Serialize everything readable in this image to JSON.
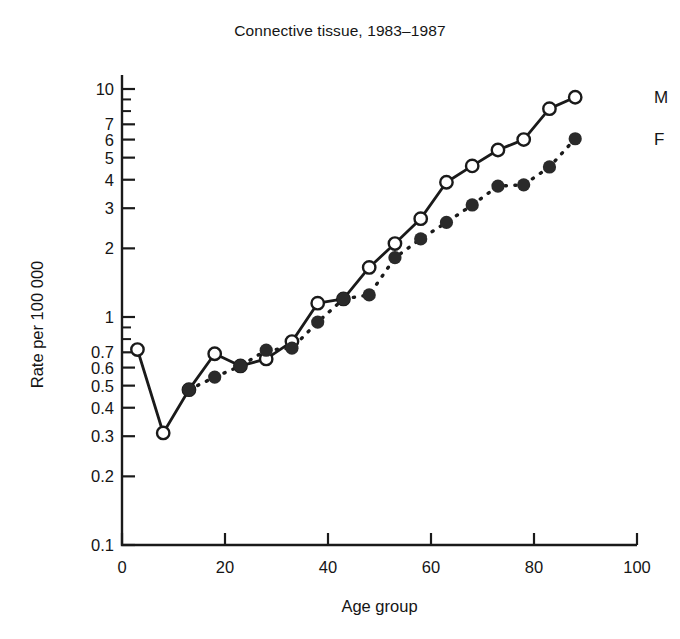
{
  "chart_data": {
    "type": "line",
    "title": "Connective tissue, 1983–1987",
    "xlabel": "Age group",
    "ylabel": "Rate per 100 000",
    "yscale": "log",
    "ylim": [
      0.1,
      11
    ],
    "xlim": [
      0,
      100
    ],
    "grid": false,
    "legend_position": "right",
    "ytick_labels": [
      "0.1",
      "0.2",
      "0.3",
      "0.4",
      "0.5",
      "0.6",
      "0.7",
      "1",
      "2",
      "3",
      "4",
      "5",
      "6",
      "7",
      "10"
    ],
    "ytick_values": [
      0.1,
      0.2,
      0.3,
      0.4,
      0.5,
      0.6,
      0.7,
      1,
      2,
      3,
      4,
      5,
      6,
      7,
      10
    ],
    "xtick_labels": [
      "0",
      "20",
      "40",
      "60",
      "80",
      "100"
    ],
    "xtick_values": [
      0,
      20,
      40,
      60,
      80,
      100
    ],
    "x": [
      3,
      8,
      13,
      18,
      23,
      28,
      33,
      38,
      43,
      48,
      53,
      58,
      63,
      68,
      73,
      78,
      83,
      88
    ],
    "series": [
      {
        "name": "M",
        "marker": "open-circle",
        "line": "solid",
        "values": [
          0.72,
          0.31,
          0.48,
          0.69,
          0.61,
          0.655,
          0.78,
          1.15,
          1.2,
          1.65,
          2.1,
          2.7,
          3.9,
          4.6,
          5.4,
          6.0,
          8.2,
          9.2
        ]
      },
      {
        "name": "F",
        "marker": "filled-circle",
        "line": "dashed",
        "values": [
          null,
          null,
          0.48,
          0.545,
          0.61,
          0.715,
          0.73,
          0.95,
          1.2,
          1.25,
          1.82,
          2.2,
          2.6,
          3.1,
          3.75,
          3.8,
          4.55,
          6.05
        ]
      }
    ],
    "legend": [
      {
        "label": "M",
        "marker": "open-circle",
        "line": "solid"
      },
      {
        "label": "F",
        "marker": "filled-circle",
        "line": "dashed"
      }
    ]
  },
  "axes": {
    "title": "Connective tissue, 1983–1987",
    "x_axis_label": "Age group",
    "y_axis_label": "Rate per 100 000"
  },
  "colors": {
    "ink": "#1a1a1a",
    "background": "#ffffff",
    "marker_fill_open": "#ffffff",
    "marker_fill_closed": "#2a2a2a"
  }
}
